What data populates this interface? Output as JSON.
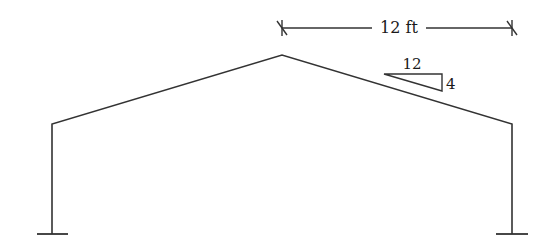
{
  "diagram": {
    "type": "gable-frame",
    "stroke_color": "#333333",
    "background": "#ffffff",
    "dimension": {
      "label": "12 ft",
      "y": 28,
      "x_start": 282,
      "x_end": 512
    },
    "slope": {
      "run_label": "12",
      "rise_label": "4"
    },
    "nodes": {
      "left_base": [
        52,
        234
      ],
      "left_eave": [
        52,
        124
      ],
      "apex": [
        282,
        55
      ],
      "right_eave": [
        512,
        124
      ],
      "right_base": [
        512,
        234
      ]
    },
    "supports": [
      {
        "name": "left-fixed-support",
        "x": 52,
        "y": 234
      },
      {
        "name": "right-fixed-support",
        "x": 512,
        "y": 234
      }
    ]
  }
}
